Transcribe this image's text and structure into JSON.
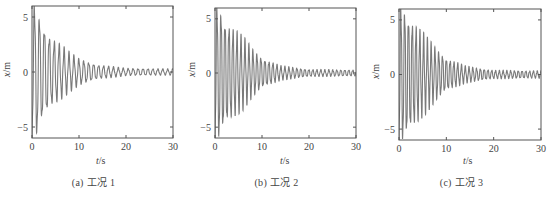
{
  "chart_data": [
    {
      "type": "line",
      "panel": "a",
      "caption": "(a) 工况 1",
      "xlabel": "t/s",
      "ylabel": "x/m",
      "xlim": [
        0,
        30
      ],
      "ylim": [
        -6,
        6
      ],
      "xticks": [
        0,
        10,
        20,
        30
      ],
      "yticks": [
        -5,
        0,
        5
      ],
      "grid": false,
      "legend": null,
      "series": [
        {
          "name": "x(t)",
          "description": "Damped oscillation with irregular decaying envelope; amplitude ~6 at start, ~0.3 after t=20 s",
          "envelope_t": [
            0,
            1,
            2,
            4,
            6,
            8,
            10,
            14,
            20,
            30
          ],
          "envelope_amp": [
            6.0,
            5.5,
            4.3,
            2.9,
            2.3,
            1.6,
            1.1,
            0.6,
            0.3,
            0.25
          ],
          "period_s": 1.05
        }
      ],
      "frame": {
        "left": 32,
        "right": 173,
        "top": 6,
        "bottom": 138
      }
    },
    {
      "type": "line",
      "panel": "b",
      "caption": "(b) 工况 2",
      "xlabel": "t/s",
      "ylabel": "x/m",
      "xlim": [
        0,
        30
      ],
      "ylim": [
        -6,
        6
      ],
      "xticks": [
        0,
        10,
        20,
        30
      ],
      "yticks": [
        -5,
        0,
        5
      ],
      "grid": false,
      "legend": null,
      "series": [
        {
          "name": "x(t)",
          "description": "Damped oscillation with smooth exponential decay; amplitude ~5.8 at start, ~0.3 after t=20 s",
          "envelope_t": [
            0,
            1,
            2,
            4,
            6,
            8,
            10,
            14,
            20,
            30
          ],
          "envelope_amp": [
            6.0,
            5.7,
            4.6,
            3.8,
            3.0,
            2.0,
            1.3,
            0.6,
            0.3,
            0.25
          ],
          "period_s": 0.85
        }
      ],
      "frame": {
        "left": 215,
        "right": 356,
        "top": 8,
        "bottom": 138
      }
    },
    {
      "type": "line",
      "panel": "c",
      "caption": "(c) 工况 3",
      "xlabel": "t/s",
      "ylabel": "x/m",
      "xlim": [
        0,
        30
      ],
      "ylim": [
        -6,
        6
      ],
      "xticks": [
        0,
        10,
        20,
        30
      ],
      "yticks": [
        -5,
        0,
        5
      ],
      "grid": false,
      "legend": null,
      "series": [
        {
          "name": "x(t)",
          "description": "Damped oscillation with smooth decay; amplitude ~5.8 at start, ~0.3 after t=20 s",
          "envelope_t": [
            0,
            1,
            2,
            4,
            6,
            8,
            10,
            14,
            20,
            30
          ],
          "envelope_amp": [
            6.0,
            5.8,
            5.0,
            4.0,
            3.0,
            2.1,
            1.4,
            0.7,
            0.35,
            0.3
          ],
          "period_s": 0.8
        }
      ],
      "frame": {
        "left": 399,
        "right": 541,
        "top": 9,
        "bottom": 140
      }
    }
  ],
  "captions": [
    "(a) 工况 1",
    "(b) 工况 2",
    "(c) 工况 3"
  ],
  "axis": {
    "x_var": "t",
    "x_unit": "/s",
    "y_var": "x",
    "y_unit": "/m"
  },
  "colors": {
    "line": "#7a7a7a",
    "axis": "#555555",
    "text": "#444444"
  }
}
